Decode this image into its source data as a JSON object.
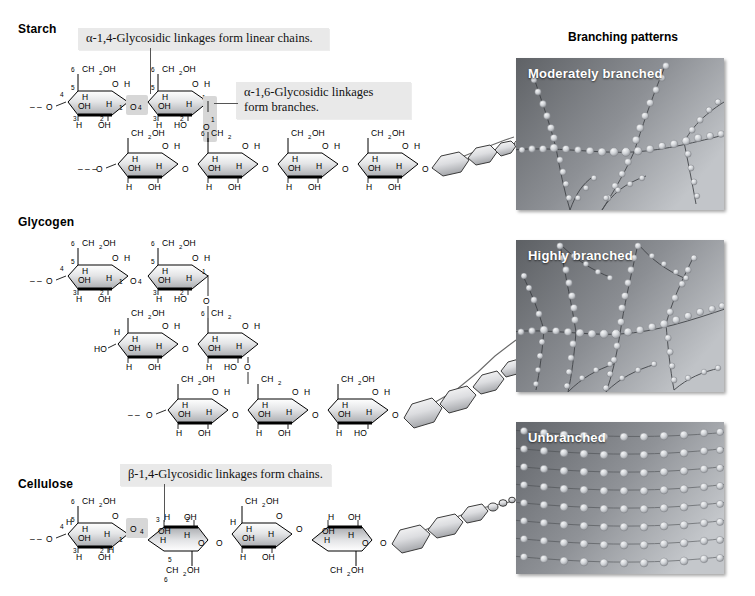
{
  "figure": {
    "panel_group_title": "Branching patterns"
  },
  "sections": [
    {
      "id": "starch",
      "label": "Starch",
      "label_x": 18,
      "label_y": 28,
      "callouts": [
        {
          "id": "alpha14",
          "text": "α-1,4-Glycosidic linkages form linear chains.",
          "x": 78,
          "y": 30,
          "w": 236
        },
        {
          "id": "alpha16",
          "text": "α-1,6-Glycosidic linkages\nform branches.",
          "x": 236,
          "y": 82,
          "w": 162
        }
      ],
      "panel": {
        "id": "moderately-branched",
        "label": "Moderately branched",
        "x": 516,
        "y": 58,
        "w": 208,
        "h": 152,
        "pattern": "moderate"
      }
    },
    {
      "id": "glycogen",
      "label": "Glycogen",
      "label_x": 18,
      "label_y": 222,
      "callouts": [],
      "panel": {
        "id": "highly-branched",
        "label": "Highly branched",
        "x": 516,
        "y": 240,
        "w": 208,
        "h": 152,
        "pattern": "high"
      }
    },
    {
      "id": "cellulose",
      "label": "Cellulose",
      "label_x": 18,
      "label_y": 484,
      "callouts": [
        {
          "id": "beta14",
          "text": "β-1,4-Glycosidic linkages form chains.",
          "x": 120,
          "y": 466,
          "w": 196
        }
      ],
      "panel": {
        "id": "unbranched",
        "label": "Unbranched",
        "x": 516,
        "y": 422,
        "w": 208,
        "h": 152,
        "pattern": "unbranched"
      }
    }
  ],
  "panel_group": {
    "title": "Branching patterns",
    "title_x": 570,
    "title_y": 36
  },
  "chemistry": {
    "atoms": {
      "ch2oh": "CH2OH",
      "ch2": "CH2",
      "oh": "OH",
      "ho": "HO",
      "h": "H",
      "o": "O"
    },
    "ring_numbers": [
      "1",
      "2",
      "3",
      "4",
      "5",
      "6"
    ],
    "bond_terminus": "––O"
  },
  "colors": {
    "callout_bg": "#e9e9e9",
    "panel_dark": "#6f7276",
    "panel_light": "#b9bcc0",
    "bead": "#c9ccd0",
    "text": "#000000",
    "hexagon_fill": "#d9dadc"
  }
}
